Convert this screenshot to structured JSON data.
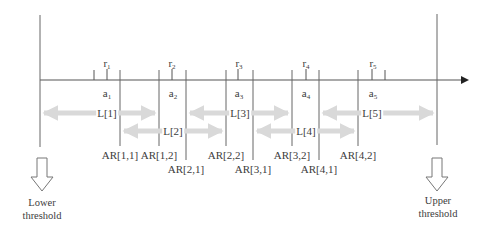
{
  "diagram": {
    "type": "interval-timeline",
    "colors": {
      "line": "#555555",
      "range_arrow": "#d9d9d9",
      "threshold_arrow_stroke": "#777777",
      "text": "#3c3c3c"
    },
    "thresholds": {
      "lower": {
        "line1": "Lower",
        "line2": "threshold"
      },
      "upper": {
        "line1": "Upper",
        "line2": "threshold"
      }
    },
    "points": [
      {
        "r": "r",
        "r_sub": "1",
        "a": "a",
        "a_sub": "1"
      },
      {
        "r": "r",
        "r_sub": "2",
        "a": "a",
        "a_sub": "2"
      },
      {
        "r": "r",
        "r_sub": "3",
        "a": "a",
        "a_sub": "3"
      },
      {
        "r": "r",
        "r_sub": "4",
        "a": "a",
        "a_sub": "4"
      },
      {
        "r": "r",
        "r_sub": "5",
        "a": "a",
        "a_sub": "5"
      }
    ],
    "ranges": [
      {
        "label": "L[1]"
      },
      {
        "label": "L[2]"
      },
      {
        "label": "L[3]"
      },
      {
        "label": "L[4]"
      },
      {
        "label": "L[5]"
      }
    ],
    "boundaries": [
      {
        "label": "AR[1,1]"
      },
      {
        "label": "AR[1,2]"
      },
      {
        "label": "AR[2,1]"
      },
      {
        "label": "AR[2,2]"
      },
      {
        "label": "AR[3,1]"
      },
      {
        "label": "AR[3,2]"
      },
      {
        "label": "AR[4,1]"
      },
      {
        "label": "AR[4,2]"
      }
    ]
  }
}
